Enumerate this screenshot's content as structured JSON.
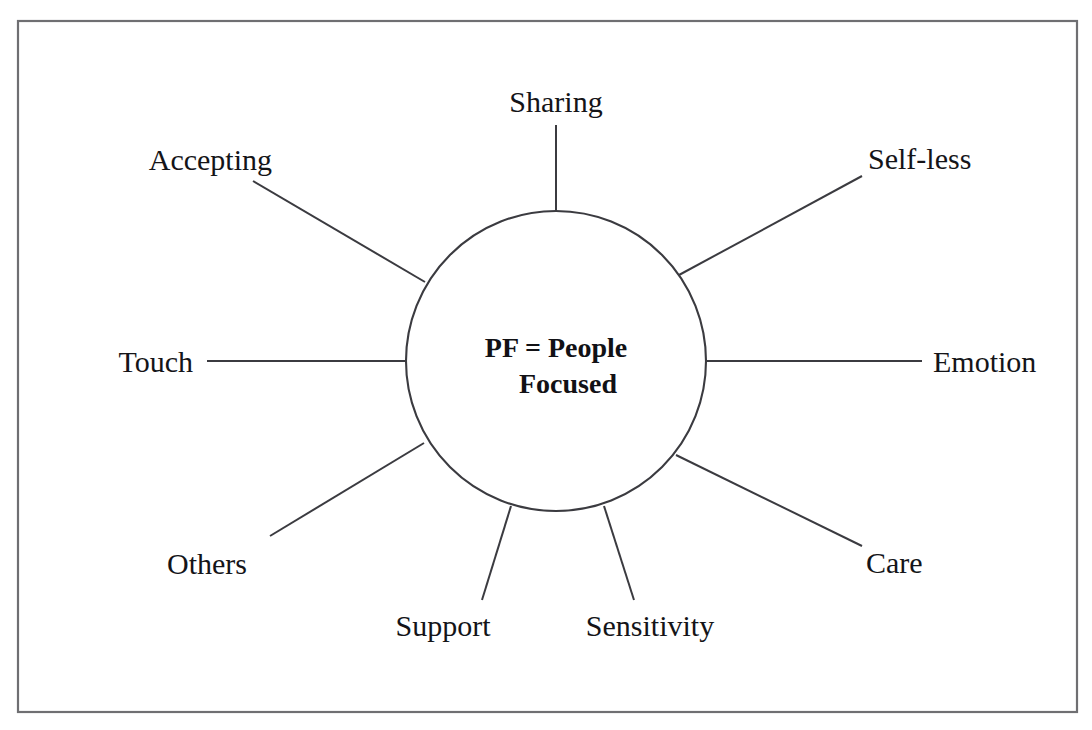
{
  "diagram": {
    "type": "radial-spoke-diagram",
    "title": "PF = People Focused",
    "frame": {
      "x": 18,
      "y": 21,
      "width": 1059,
      "height": 691,
      "stroke_color": "#6f6f72"
    },
    "hub": {
      "center_x": 556,
      "center_y": 361,
      "radius": 150,
      "line1": "PF = People",
      "line2": "Focused",
      "stroke_color": "#3b3b40",
      "fill_color": "#ffffff"
    },
    "line_color": "#3b3b40",
    "text_color": "#141418",
    "background_color": "#ffffff",
    "nodes": [
      {
        "id": "sharing",
        "label": "Sharing",
        "angle_deg": 90,
        "spoke": {
          "x1": 556,
          "y1": 211,
          "x2": 556,
          "y2": 125
        },
        "label_x": 556,
        "label_y": 112,
        "anchor": "middle"
      },
      {
        "id": "self-less",
        "label": "Self-less",
        "angle_deg": 35,
        "spoke": {
          "x1": 679,
          "y1": 275,
          "x2": 862,
          "y2": 176
        },
        "label_x": 868,
        "label_y": 169,
        "anchor": "start"
      },
      {
        "id": "emotion",
        "label": "Emotion",
        "angle_deg": 0,
        "spoke": {
          "x1": 707,
          "y1": 361,
          "x2": 922,
          "y2": 361
        },
        "label_x": 933,
        "label_y": 372,
        "anchor": "start"
      },
      {
        "id": "care",
        "label": "Care",
        "angle_deg": -38,
        "spoke": {
          "x1": 676,
          "y1": 455,
          "x2": 862,
          "y2": 546
        },
        "label_x": 866,
        "label_y": 573,
        "anchor": "start"
      },
      {
        "id": "sensitivity",
        "label": "Sensitivity",
        "angle_deg": -72,
        "spoke": {
          "x1": 604,
          "y1": 506,
          "x2": 634,
          "y2": 600
        },
        "label_x": 650,
        "label_y": 636,
        "anchor": "middle"
      },
      {
        "id": "support",
        "label": "Support",
        "angle_deg": -108,
        "spoke": {
          "x1": 511,
          "y1": 506,
          "x2": 482,
          "y2": 600
        },
        "label_x": 443,
        "label_y": 636,
        "anchor": "middle"
      },
      {
        "id": "others",
        "label": "Others",
        "angle_deg": -148,
        "spoke": {
          "x1": 424,
          "y1": 443,
          "x2": 270,
          "y2": 536
        },
        "label_x": 167,
        "label_y": 574,
        "anchor": "start"
      },
      {
        "id": "touch",
        "label": "Touch",
        "angle_deg": 180,
        "spoke": {
          "x1": 405,
          "y1": 361,
          "x2": 207,
          "y2": 361
        },
        "label_x": 193,
        "label_y": 372,
        "anchor": "end"
      },
      {
        "id": "accepting",
        "label": "Accepting",
        "angle_deg": 148,
        "spoke": {
          "x1": 425,
          "y1": 282,
          "x2": 253,
          "y2": 181
        },
        "label_x": 272,
        "label_y": 170,
        "anchor": "end"
      }
    ]
  }
}
